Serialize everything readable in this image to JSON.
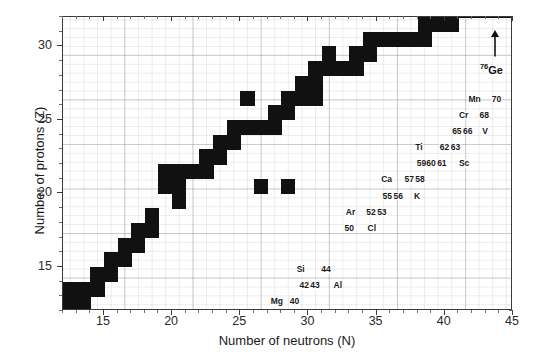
{
  "chart_data": {
    "type": "heatmap",
    "title": "",
    "xlabel": "Number of neutrons (N)",
    "ylabel": "Number of protons (Z)",
    "xlim": [
      12,
      45
    ],
    "ylim": [
      12,
      32
    ],
    "xticks": [
      15,
      20,
      25,
      30,
      35,
      40,
      45
    ],
    "yticks": [
      15,
      20,
      25,
      30
    ],
    "xtick_labels": [
      "15",
      "20",
      "25",
      "30",
      "35",
      "40",
      "45"
    ],
    "ytick_labels": [
      "15",
      "20",
      "25",
      "30"
    ],
    "grid": true,
    "legend": null,
    "cell_color": "#111111",
    "cells": [
      [
        12,
        12
      ],
      [
        13,
        12
      ],
      [
        12,
        13
      ],
      [
        13,
        13
      ],
      [
        14,
        13
      ],
      [
        14,
        14
      ],
      [
        15,
        14
      ],
      [
        15,
        15
      ],
      [
        16,
        15
      ],
      [
        16,
        16
      ],
      [
        17,
        16
      ],
      [
        17,
        17
      ],
      [
        18,
        17
      ],
      [
        18,
        18
      ],
      [
        20,
        19
      ],
      [
        20,
        20
      ],
      [
        19,
        20
      ],
      [
        19,
        21
      ],
      [
        20,
        21
      ],
      [
        21,
        21
      ],
      [
        22,
        21
      ],
      [
        22,
        22
      ],
      [
        23,
        22
      ],
      [
        23,
        23
      ],
      [
        24,
        23
      ],
      [
        24,
        24
      ],
      [
        25,
        24
      ],
      [
        26,
        24
      ],
      [
        27,
        24
      ],
      [
        26,
        20
      ],
      [
        28,
        20
      ],
      [
        25,
        26
      ],
      [
        27,
        25
      ],
      [
        28,
        25
      ],
      [
        28,
        26
      ],
      [
        29,
        26
      ],
      [
        30,
        26
      ],
      [
        29,
        27
      ],
      [
        30,
        27
      ],
      [
        30,
        28
      ],
      [
        31,
        28
      ],
      [
        32,
        28
      ],
      [
        33,
        28
      ],
      [
        31,
        29
      ],
      [
        33,
        29
      ],
      [
        34,
        29
      ],
      [
        34,
        30
      ],
      [
        35,
        30
      ],
      [
        36,
        30
      ],
      [
        37,
        30
      ],
      [
        38,
        30
      ],
      [
        38,
        31
      ],
      [
        39,
        31
      ],
      [
        40,
        31
      ],
      [
        40,
        32
      ],
      [
        41,
        32
      ],
      [
        42,
        32
      ],
      [
        43,
        32
      ],
      [
        44,
        32
      ]
    ],
    "annotations": [
      {
        "text": "Mg",
        "n": 27.2,
        "z": 12.3
      },
      {
        "text": "40",
        "n": 28.6,
        "z": 12.3
      },
      {
        "text": "42",
        "n": 29.3,
        "z": 13.4
      },
      {
        "text": "43",
        "n": 30.1,
        "z": 13.4
      },
      {
        "text": "Al",
        "n": 31.8,
        "z": 13.4
      },
      {
        "text": "Si",
        "n": 29.1,
        "z": 14.5
      },
      {
        "text": "44",
        "n": 30.9,
        "z": 14.5
      },
      {
        "text": "50",
        "n": 32.6,
        "z": 17.3
      },
      {
        "text": "Cl",
        "n": 34.3,
        "z": 17.3
      },
      {
        "text": "Ar",
        "n": 32.7,
        "z": 18.4
      },
      {
        "text": "52",
        "n": 34.2,
        "z": 18.4
      },
      {
        "text": "53",
        "n": 35.0,
        "z": 18.4
      },
      {
        "text": "55",
        "n": 35.4,
        "z": 19.5
      },
      {
        "text": "56",
        "n": 36.2,
        "z": 19.5
      },
      {
        "text": "K",
        "n": 37.7,
        "z": 19.5
      },
      {
        "text": "Ca",
        "n": 35.3,
        "z": 20.6
      },
      {
        "text": "57",
        "n": 37.0,
        "z": 20.6
      },
      {
        "text": "58",
        "n": 37.8,
        "z": 20.6
      },
      {
        "text": "59",
        "n": 37.9,
        "z": 21.7
      },
      {
        "text": "60",
        "n": 38.6,
        "z": 21.7
      },
      {
        "text": "61",
        "n": 39.4,
        "z": 21.7
      },
      {
        "text": "Sc",
        "n": 41.0,
        "z": 21.7
      },
      {
        "text": "Ti",
        "n": 37.8,
        "z": 22.8
      },
      {
        "text": "62",
        "n": 39.6,
        "z": 22.8
      },
      {
        "text": "63",
        "n": 40.4,
        "z": 22.8
      },
      {
        "text": "65",
        "n": 40.5,
        "z": 23.9
      },
      {
        "text": "66",
        "n": 41.3,
        "z": 23.9
      },
      {
        "text": "V",
        "n": 42.7,
        "z": 23.9
      },
      {
        "text": "Cr",
        "n": 41.0,
        "z": 25.0
      },
      {
        "text": "68",
        "n": 42.5,
        "z": 25.0
      },
      {
        "text": "Mn",
        "n": 41.7,
        "z": 26.1
      },
      {
        "text": "70",
        "n": 43.4,
        "z": 26.1
      }
    ],
    "callout": {
      "label_prefix": "76",
      "label_element": "Ge",
      "arrow": "up",
      "n": 43.6,
      "z_label": 28.4,
      "z_arrow_from": 29.3,
      "z_arrow_to": 31.1
    }
  },
  "axes": {
    "x_title": "Number of neutrons (N)",
    "y_title": "Number of protons (Z)"
  }
}
